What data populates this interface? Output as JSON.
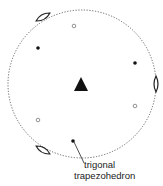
{
  "diagram": {
    "type": "stereographic-projection",
    "circle": {
      "cx": 82,
      "cy": 84,
      "r": 74,
      "style": "dotted"
    },
    "center_symbol": {
      "shape": "triangle",
      "meaning": "3-fold axis",
      "x": 81,
      "y": 85
    },
    "twofold_axes": [
      {
        "x": 43,
        "y": 17,
        "angle": -30
      },
      {
        "x": 156,
        "y": 84,
        "angle": 90
      },
      {
        "x": 43,
        "y": 150,
        "angle": 30
      }
    ],
    "filled_points": [
      {
        "x": 38,
        "y": 48
      },
      {
        "x": 135,
        "y": 63
      },
      {
        "x": 73,
        "y": 141
      }
    ],
    "open_points": [
      {
        "x": 74,
        "y": 26
      },
      {
        "x": 135,
        "y": 106
      },
      {
        "x": 38,
        "y": 120
      }
    ],
    "label": {
      "line1": "trigonal",
      "line2": "trapezohedron"
    }
  }
}
